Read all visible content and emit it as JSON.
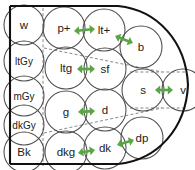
{
  "diagram": {
    "colors": {
      "arrow": "#5aa544",
      "circle_stroke": "#4d4d4d",
      "boundary_stroke": "#111111",
      "guide_dashed": "#7a7a7a",
      "label_text": "#222222",
      "background": "#ffffff"
    },
    "value_scale": {
      "name": "grayscale-value-column",
      "items": [
        {
          "id": "w",
          "label": "w",
          "cx": 24,
          "cy": 25,
          "r": 20
        },
        {
          "id": "ltGy",
          "label": "ltGy",
          "cx": 24,
          "cy": 61,
          "r": 20
        },
        {
          "id": "mGy",
          "label": "mGy",
          "cx": 24,
          "cy": 96,
          "r": 20
        },
        {
          "id": "dkGy",
          "label": "dkGy",
          "cx": 24,
          "cy": 125,
          "r": 20
        },
        {
          "id": "Bk",
          "label": "Bk",
          "cx": 24,
          "cy": 152,
          "r": 20
        }
      ]
    },
    "hue_nodes": [
      {
        "id": "p-plus",
        "label": "p+",
        "cx": 64,
        "cy": 28,
        "r": 21
      },
      {
        "id": "lt-plus",
        "label": "lt+",
        "cx": 104,
        "cy": 30,
        "r": 21
      },
      {
        "id": "b",
        "label": "b",
        "cx": 141,
        "cy": 47,
        "r": 21
      },
      {
        "id": "ltg",
        "label": "ltg",
        "cx": 66,
        "cy": 68,
        "r": 21
      },
      {
        "id": "sf",
        "label": "sf",
        "cx": 105,
        "cy": 69,
        "r": 21
      },
      {
        "id": "s",
        "label": "s",
        "cx": 143,
        "cy": 90,
        "r": 21
      },
      {
        "id": "v",
        "label": "v",
        "cx": 183,
        "cy": 90,
        "r": 21
      },
      {
        "id": "g",
        "label": "g",
        "cx": 66,
        "cy": 112,
        "r": 21
      },
      {
        "id": "d",
        "label": "d",
        "cx": 105,
        "cy": 110,
        "r": 21
      },
      {
        "id": "dkg",
        "label": "dkg",
        "cx": 66,
        "cy": 152,
        "r": 21
      },
      {
        "id": "dk",
        "label": "dk",
        "cx": 105,
        "cy": 148,
        "r": 21
      },
      {
        "id": "dp",
        "label": "dp",
        "cx": 142,
        "cy": 138,
        "r": 21
      }
    ],
    "connections": [
      {
        "id": "p-plus--lt-plus",
        "from": "p+",
        "to": "lt+",
        "x1": 74,
        "y1": 31,
        "x2": 95,
        "y2": 29
      },
      {
        "id": "lt-plus--b",
        "from": "lt+",
        "to": "b",
        "x1": 115,
        "y1": 36,
        "x2": 133,
        "y2": 43
      },
      {
        "id": "ltg--sf",
        "from": "ltg",
        "to": "sf",
        "x1": 77,
        "y1": 69,
        "x2": 95,
        "y2": 69
      },
      {
        "id": "s--v",
        "from": "s",
        "to": "v",
        "x1": 155,
        "y1": 90,
        "x2": 173,
        "y2": 90
      },
      {
        "id": "g--d",
        "from": "g",
        "to": "d",
        "x1": 78,
        "y1": 112,
        "x2": 95,
        "y2": 111
      },
      {
        "id": "dkg--dk",
        "from": "dkg",
        "to": "dk",
        "x1": 78,
        "y1": 153,
        "x2": 95,
        "y2": 150
      },
      {
        "id": "dk--dp",
        "from": "dk",
        "to": "dp",
        "x1": 117,
        "y1": 145,
        "x2": 134,
        "y2": 140
      }
    ],
    "guides": [
      {
        "id": "vertical-divider",
        "d": "M 43 8 L 43 166"
      },
      {
        "id": "upper-diagonal",
        "d": "M 44 48 L 162 72"
      },
      {
        "id": "upper-right-horizontal",
        "d": "M 130 72 L 186 72"
      },
      {
        "id": "lower-right-horizontal",
        "d": "M 130 108 L 186 108"
      },
      {
        "id": "lower-diagonal",
        "d": "M 44 133 L 162 108"
      }
    ],
    "boundary": {
      "id": "pointed-oval-boundary",
      "d": "M 10 6 L 118 6 C 158 10 186 42 188 85 C 186 128 158 160 118 164 L 10 164"
    },
    "left_rail": {
      "id": "left-vertical-rail",
      "d": "M 10 6 L 10 164"
    }
  }
}
